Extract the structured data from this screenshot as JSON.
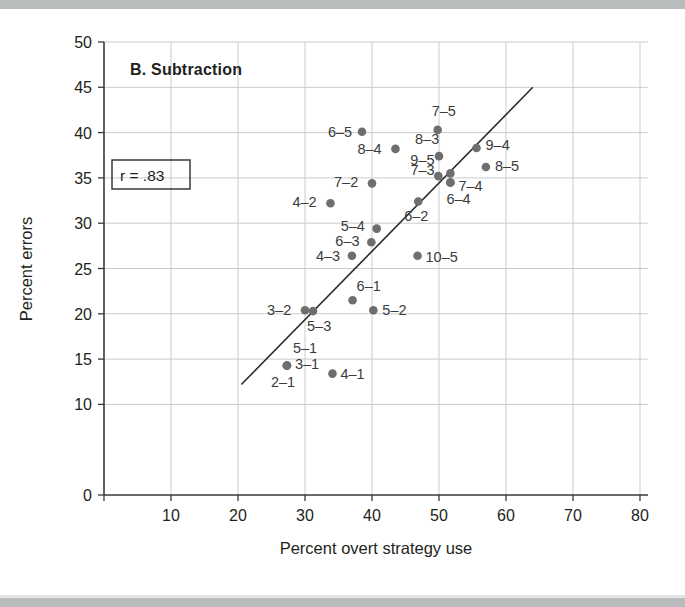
{
  "figure": {
    "panel_title": "B. Subtraction",
    "annotation": "r = .83",
    "dot_color": "#6e6e6e",
    "line_color": "#2b2b2b",
    "grid_color": "#c9cbcc"
  },
  "chart_data": {
    "type": "scatter",
    "title": "B. Subtraction",
    "xlabel": "Percent overt strategy use",
    "ylabel": "Percent errors",
    "xlim": [
      0,
      80
    ],
    "ylim": [
      0,
      50
    ],
    "xticks": [
      0,
      10,
      20,
      30,
      40,
      50,
      60,
      70,
      80
    ],
    "yticks": [
      0,
      10,
      15,
      20,
      25,
      30,
      35,
      40,
      45,
      50
    ],
    "grid": true,
    "legend": null,
    "annotations": [
      {
        "text": "r = .83",
        "boxed": true
      }
    ],
    "correlation": 0.83,
    "points": [
      {
        "label": "6-5",
        "x": 38.5,
        "y": 40.1,
        "label_side": "left"
      },
      {
        "label": "7-5",
        "x": 49.8,
        "y": 40.3,
        "label_side": "above-right"
      },
      {
        "label": "8-4",
        "x": 43.5,
        "y": 38.2,
        "label_side": "left"
      },
      {
        "label": "8-3",
        "x": 50.0,
        "y": 37.4,
        "label_side": "above-left"
      },
      {
        "label": "9-4",
        "x": 55.6,
        "y": 38.3,
        "label_side": "right"
      },
      {
        "label": "9-5",
        "x": 49.9,
        "y": 35.2,
        "label_side": "above-left"
      },
      {
        "label": "8-5",
        "x": 57.0,
        "y": 36.2,
        "label_side": "right"
      },
      {
        "label": "7-2",
        "x": 40.0,
        "y": 34.4,
        "label_side": "left"
      },
      {
        "label": "7-3",
        "x": 51.7,
        "y": 35.5,
        "label_side": "left"
      },
      {
        "label": "7-4",
        "x": 51.7,
        "y": 34.5,
        "label_side": "right"
      },
      {
        "label": "6-4",
        "x": 51.7,
        "y": 34.5,
        "label_side": "below-right"
      },
      {
        "label": "4-2",
        "x": 33.8,
        "y": 32.2,
        "label_side": "left"
      },
      {
        "label": "6-2",
        "x": 46.9,
        "y": 32.4,
        "label_side": "below-right"
      },
      {
        "label": "5-4",
        "x": 40.7,
        "y": 29.4,
        "label_side": "left"
      },
      {
        "label": "6-3",
        "x": 39.9,
        "y": 27.9,
        "label_side": "left"
      },
      {
        "label": "4-3",
        "x": 37.0,
        "y": 26.4,
        "label_side": "left"
      },
      {
        "label": "10-5",
        "x": 46.8,
        "y": 26.4,
        "label_side": "right"
      },
      {
        "label": "6-1",
        "x": 37.1,
        "y": 21.5,
        "label_side": "above-right"
      },
      {
        "label": "3-2",
        "x": 30.0,
        "y": 20.4,
        "label_side": "left"
      },
      {
        "label": "5-3",
        "x": 31.2,
        "y": 20.3,
        "label_side": "below-right"
      },
      {
        "label": "5-2",
        "x": 40.2,
        "y": 20.4,
        "label_side": "right"
      },
      {
        "label": "5-1",
        "x": 27.3,
        "y": 14.3,
        "label_side": "above-right"
      },
      {
        "label": "3-1",
        "x": 27.3,
        "y": 14.3,
        "label_side": "right"
      },
      {
        "label": "2-1",
        "x": 27.3,
        "y": 14.3,
        "label_side": "below-left"
      },
      {
        "label": "4-1",
        "x": 34.1,
        "y": 13.4,
        "label_side": "right"
      }
    ],
    "fit_line": {
      "x1": 20.5,
      "y1": 12.2,
      "x2": 64.0,
      "y2": 45.0
    }
  }
}
